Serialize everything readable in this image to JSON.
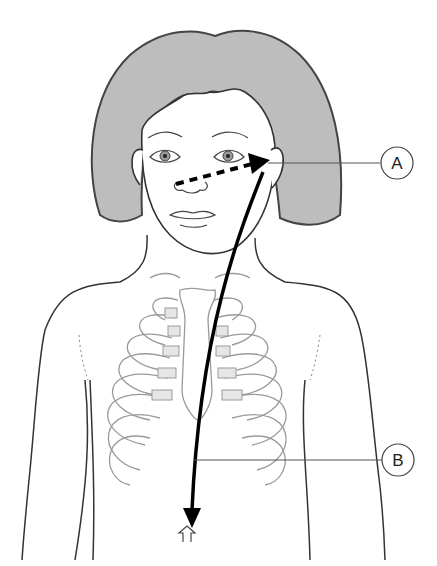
{
  "figure": {
    "labels": [
      {
        "id": "A",
        "text": "A",
        "points_to": "ear"
      },
      {
        "id": "B",
        "text": "B",
        "points_to": "lower abdomen / arrow path"
      }
    ],
    "arrows": [
      {
        "name": "dashed-arrow",
        "style": "dashed",
        "from": "nose",
        "to": "ear"
      },
      {
        "name": "solid-arrow",
        "style": "solid",
        "from": "ear",
        "to": "abdomen"
      }
    ],
    "colors": {
      "hair": "#bdbdbd",
      "outline": "#333333",
      "ribs": "#9a9a9a",
      "arrow": "#000000"
    }
  }
}
